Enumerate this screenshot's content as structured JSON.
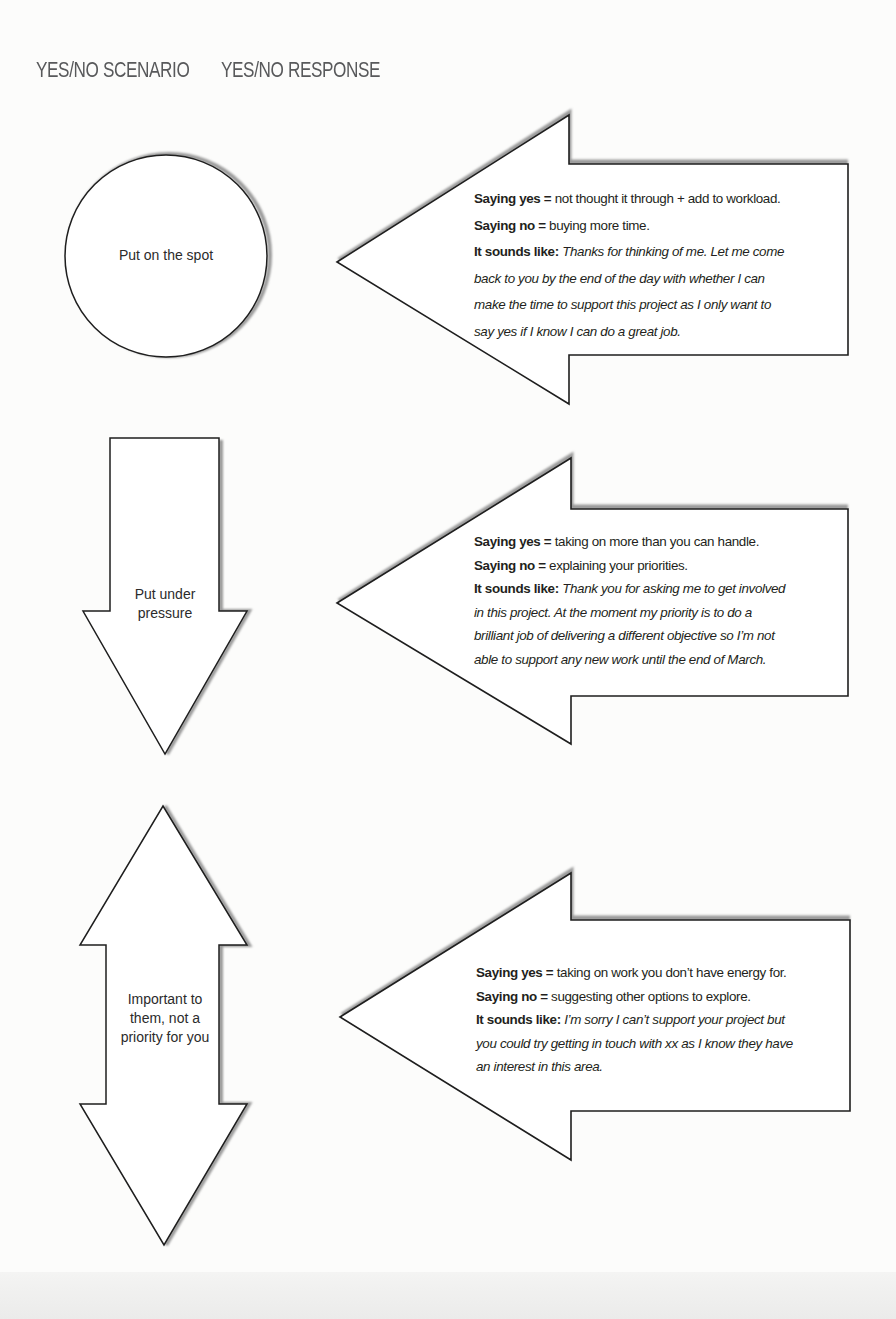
{
  "headings": {
    "scenario": "YES/NO SCENARIO",
    "response": "YES/NO RESPONSE"
  },
  "colors": {
    "text": "#231f20",
    "heading": "#58595b",
    "outline": "#1e1e1e",
    "shadow": "#9a9a9a",
    "background": "#fcfcfb"
  },
  "rows": [
    {
      "scenario": {
        "shape": "circle",
        "label_lines": [
          "Put on the spot"
        ]
      },
      "response": {
        "shape": "left-arrow",
        "yes_label": "Saying yes =",
        "yes_text": " not thought it through + add to workload.",
        "no_label": "Saying no =",
        "no_text": " buying more time.",
        "sounds_label": "It sounds like:",
        "sounds_lines": [
          " Thanks for thinking of me. Let me come",
          "back to you by the end of the day with whether I can",
          "make the time to support this project as I only want to",
          "say yes if I know I can do a great job."
        ]
      }
    },
    {
      "scenario": {
        "shape": "down-arrow",
        "label_lines": [
          "Put under",
          "pressure"
        ]
      },
      "response": {
        "shape": "left-arrow",
        "yes_label": "Saying yes =",
        "yes_text": " taking on more than you can handle.",
        "no_label": "Saying no =",
        "no_text": " explaining your priorities.",
        "sounds_label": "It sounds like:",
        "sounds_lines": [
          " Thank you for asking me to get involved",
          "in this project. At the moment my priority is to do a",
          "brilliant job of delivering a different objective so I’m not",
          "able to support any new work until the end of March."
        ]
      }
    },
    {
      "scenario": {
        "shape": "up-down-arrow",
        "label_lines": [
          "Important to",
          "them, not a",
          "priority for you"
        ]
      },
      "response": {
        "shape": "left-arrow",
        "yes_label": "Saying yes =",
        "yes_text": " taking on work you don’t have energy for.",
        "no_label": "Saying no =",
        "no_text": " suggesting other options to explore.",
        "sounds_label": "It sounds like:",
        "sounds_lines": [
          " I’m sorry I can’t support your project but",
          "you could try getting in touch with xx as I know they have",
          "an interest in this area."
        ]
      }
    }
  ]
}
